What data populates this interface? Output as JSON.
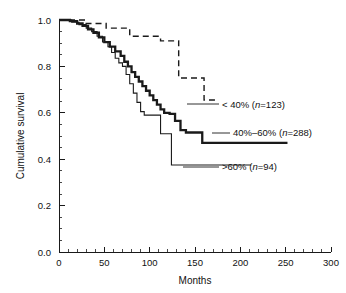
{
  "chart_data": {
    "type": "line",
    "title": "",
    "subtitle": "",
    "xlabel": "Months",
    "ylabel": "Cumulative survival",
    "xlim": [
      0,
      300
    ],
    "ylim": [
      0.0,
      1.0
    ],
    "grid": false,
    "legend_position": "inline-right-annotations",
    "x_ticks": [
      0,
      50,
      100,
      150,
      200,
      250,
      300
    ],
    "x_tick_labels": [
      "0",
      "50",
      "100",
      "150",
      "200",
      "250",
      "300"
    ],
    "x_minor_step": 10,
    "y_ticks": [
      0.0,
      0.2,
      0.4,
      0.6,
      0.8,
      1.0
    ],
    "y_tick_labels": [
      "0.0",
      "0.2",
      "0.4",
      "0.6",
      "0.8",
      "1.0"
    ],
    "y_minor_step": 0.05,
    "series": [
      {
        "name": "lt40",
        "label_prefix": "< 40% (",
        "label_italic": "n",
        "label_suffix": "=123)",
        "label_full": "< 40% (n=123)",
        "group": "< 40%",
        "n": 123,
        "style": "dashed",
        "stroke_width": 1.4,
        "color": "#1a1a1a",
        "dash_pattern": "6,4",
        "x": [
          0,
          14,
          30,
          44,
          52,
          60,
          78,
          96,
          112,
          120,
          132,
          148,
          160
        ],
        "y": [
          1.0,
          1.0,
          0.985,
          0.985,
          0.965,
          0.965,
          0.93,
          0.93,
          0.91,
          0.91,
          0.75,
          0.75,
          0.655
        ],
        "plateau_value": 0.655,
        "plateau_end_x": 175
      },
      {
        "name": "mid4060",
        "label_prefix": "40%–60% (",
        "label_italic": "n",
        "label_suffix": "=288)",
        "label_full": "40%–60% (n=288)",
        "group": "40%–60%",
        "n": 288,
        "style": "solid-thick",
        "stroke_width": 2.3,
        "color": "#1a1a1a",
        "dash_pattern": "none",
        "x": [
          0,
          12,
          20,
          26,
          32,
          38,
          44,
          50,
          56,
          62,
          68,
          72,
          76,
          80,
          84,
          88,
          92,
          96,
          100,
          104,
          108,
          112,
          116,
          122,
          128,
          134,
          140,
          148,
          158
        ],
        "y": [
          1.0,
          0.995,
          0.985,
          0.975,
          0.96,
          0.945,
          0.925,
          0.905,
          0.885,
          0.865,
          0.845,
          0.82,
          0.8,
          0.775,
          0.755,
          0.735,
          0.715,
          0.695,
          0.675,
          0.655,
          0.635,
          0.615,
          0.6,
          0.595,
          0.565,
          0.525,
          0.515,
          0.515,
          0.47
        ],
        "plateau_value": 0.47,
        "plateau_end_x": 252
      },
      {
        "name": "gt60",
        "label_prefix": ">60% (",
        "label_italic": "n",
        "label_suffix": "=94)",
        "label_full": ">60% (n=94)",
        "group": ">60%",
        "n": 94,
        "style": "solid-thin",
        "stroke_width": 1.1,
        "color": "#1a1a1a",
        "dash_pattern": "none",
        "x": [
          0,
          14,
          22,
          30,
          36,
          42,
          48,
          54,
          58,
          62,
          66,
          70,
          74,
          78,
          82,
          86,
          90,
          94,
          104,
          112,
          118,
          124
        ],
        "y": [
          1.0,
          0.99,
          0.98,
          0.965,
          0.95,
          0.93,
          0.905,
          0.885,
          0.86,
          0.835,
          0.815,
          0.8,
          0.765,
          0.725,
          0.685,
          0.645,
          0.605,
          0.59,
          0.59,
          0.51,
          0.51,
          0.375
        ],
        "plateau_value": 0.375,
        "plateau_end_x": 212
      }
    ],
    "annotations": [
      {
        "name": "lt40",
        "text": "< 40% (n=123)",
        "x_px": 222,
        "y_px": 108,
        "leader_from_x_px": 187,
        "leader_to_x_px": 219,
        "leader_y_px": 104
      },
      {
        "name": "mid4060",
        "text": "40%–60% (n=288)",
        "x_px": 233,
        "y_px": 136,
        "leader_from_x_px": 212,
        "leader_to_x_px": 230,
        "leader_y_px": 133
      },
      {
        "name": "gt60",
        "text": ">60% (n=94)",
        "x_px": 222,
        "y_px": 170,
        "leader_from_x_px": 183,
        "leader_to_x_px": 219,
        "leader_y_px": 167
      }
    ]
  },
  "axes": {
    "x_axis_title": "Months",
    "y_axis_title": "Cumulative survival"
  },
  "colors": {
    "background": "#ffffff",
    "ink": "#1a1a1a",
    "text": "#111111"
  }
}
